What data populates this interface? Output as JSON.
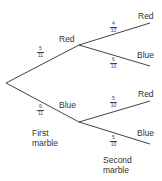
{
  "diagram": {
    "type": "probability-tree",
    "first_level": {
      "caption_line1": "First",
      "caption_line2": "marble",
      "branches": [
        {
          "label": "Red",
          "num": "5",
          "den": "11"
        },
        {
          "label": "Blue",
          "num": "6",
          "den": "11"
        }
      ]
    },
    "second_level": {
      "caption_line1": "Second",
      "caption_line2": "marble",
      "after_red": [
        {
          "label": "Red",
          "num": "4",
          "den": "10"
        },
        {
          "label": "Blue",
          "num": "6",
          "den": "10"
        }
      ],
      "after_blue": [
        {
          "label": "Red",
          "num": "5",
          "den": "10"
        },
        {
          "label": "Blue",
          "num": "5",
          "den": "10"
        }
      ]
    },
    "line_color": "#444444"
  }
}
